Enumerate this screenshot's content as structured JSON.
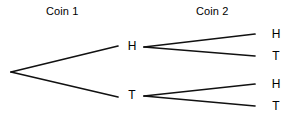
{
  "diagram": {
    "kind": "probability-tree",
    "line_color": "#111111",
    "background_color": "#ffffff",
    "text_color": "#000000"
  },
  "stages": [
    {
      "id": "coin1",
      "label": "Coin 1"
    },
    {
      "id": "coin2",
      "label": "Coin 2"
    }
  ],
  "nodes": {
    "coin1_heads": "H",
    "coin1_tails": "T",
    "coin2_heads_after_heads": "H",
    "coin2_tails_after_heads": "T",
    "coin2_heads_after_tails": "H",
    "coin2_tails_after_tails": "T"
  }
}
